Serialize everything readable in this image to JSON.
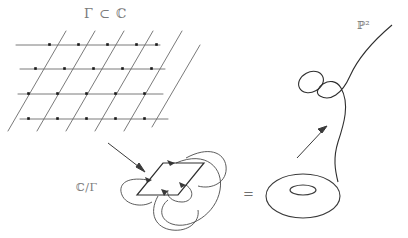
{
  "figure": {
    "labels": {
      "lattice": "Γ ⊂ ℂ",
      "quotient": "ℂ/Γ",
      "projective_plane": "ℙ²",
      "equals": "="
    },
    "ink_color": "#3a3a3a",
    "lattice_line_color": "#6b6b6b",
    "lattice_point_color": "#1a1a1a",
    "label_color": "#7a7a7a",
    "background": "#ffffff"
  },
  "panels": {
    "lattice": {
      "name": "lattice-grid",
      "description": "period lattice in the complex plane drawn as horizontal lines crossed by parallel diagonals with marked lattice points",
      "horizontal_rows": 4,
      "diagonal_count": 6,
      "marked_points": 22
    },
    "fundamental_domain": {
      "name": "fundamental-parallelogram",
      "description": "fundamental parallelogram with curved arrows identifying opposite edges",
      "edge_identification_pairs": 2
    },
    "torus": {
      "name": "torus",
      "description": "donut surface obtained by gluing opposite edges of the parallelogram"
    },
    "cubic_curve": {
      "name": "elliptic-curve-in-projective-plane",
      "description": "real points of a cubic: an S-shaped unbounded branch together with a separate closed oval",
      "components": [
        "oval",
        "unbounded-branch"
      ]
    }
  },
  "arrows": [
    {
      "name": "arrow-lattice-to-quotient",
      "from": "lattice-grid",
      "to": "fundamental-parallelogram"
    },
    {
      "name": "arrow-torus-to-curve",
      "from": "torus",
      "to": "elliptic-curve-in-projective-plane"
    }
  ]
}
